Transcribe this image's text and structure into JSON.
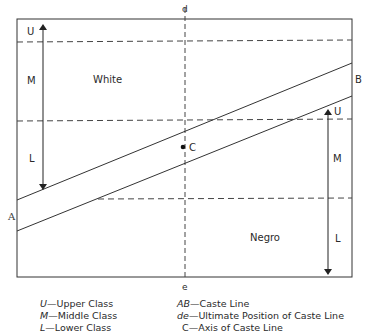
{
  "diagram": {
    "top_axis_label": "d",
    "bottom_axis_label": "e",
    "region_white": "White",
    "region_negro": "Negro",
    "point_A": "A",
    "point_B": "B",
    "point_C": "C",
    "white_classes": {
      "upper": "U",
      "middle": "M",
      "lower": "L"
    },
    "negro_classes": {
      "upper": "U",
      "middle": "M",
      "lower": "L"
    }
  },
  "legend": {
    "left": [
      {
        "key": "U",
        "sep": "—",
        "text": "Upper Class"
      },
      {
        "key": "M",
        "sep": "—",
        "text": "Middle Class"
      },
      {
        "key": "L",
        "sep": "—",
        "text": "Lower Class"
      }
    ],
    "right": [
      {
        "key": "AB",
        "sep": "—",
        "text": "Caste Line"
      },
      {
        "key": "de",
        "sep": "—",
        "text": "Ultimate Position of Caste Line"
      },
      {
        "key": "C",
        "sep": "—",
        "text": "Axis of Caste Line"
      }
    ]
  }
}
